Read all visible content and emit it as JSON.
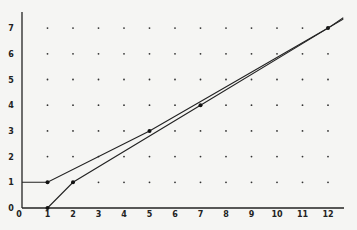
{
  "chart_data": {
    "type": "line",
    "title": "",
    "xlabel": "",
    "ylabel": "",
    "xlim": [
      0,
      12.7
    ],
    "ylim": [
      0,
      7.5
    ],
    "x_ticks": [
      "0",
      "1",
      "2",
      "3",
      "4",
      "5",
      "6",
      "7",
      "8",
      "9",
      "10",
      "11",
      "12"
    ],
    "y_ticks": [
      "0",
      "1",
      "2",
      "3",
      "4",
      "5",
      "6",
      "7"
    ],
    "grid": "dot lattice at integer points",
    "legend": null,
    "series": [
      {
        "name": "upper path",
        "points": [
          [
            0,
            1
          ],
          [
            1,
            1
          ],
          [
            5,
            3
          ],
          [
            12,
            7
          ],
          [
            12.6,
            7.35
          ]
        ],
        "marked": [
          [
            1,
            1
          ],
          [
            5,
            3
          ],
          [
            12,
            7
          ]
        ]
      },
      {
        "name": "lower path",
        "points": [
          [
            1,
            0
          ],
          [
            2,
            1
          ],
          [
            7,
            4
          ],
          [
            12,
            7
          ],
          [
            12.6,
            7.4
          ]
        ],
        "marked": [
          [
            1,
            0
          ],
          [
            2,
            1
          ],
          [
            7,
            4
          ]
        ]
      }
    ]
  }
}
